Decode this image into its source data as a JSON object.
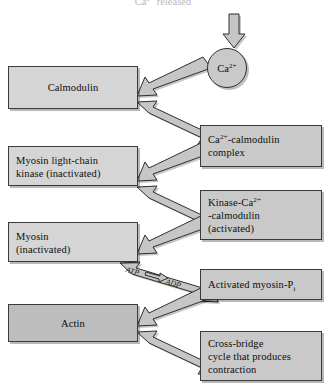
{
  "diagram": {
    "title_cutoff": "Ca2+ released",
    "trigger_arrow": "down-arrow",
    "ion_node": {
      "label": "Ca2+",
      "shape": "circle"
    },
    "left_boxes": [
      {
        "id": "calmodulin",
        "label": "Calmodulin"
      },
      {
        "id": "mlck",
        "lines": [
          "Myosin light-chain",
          "kinase (inactivated)"
        ]
      },
      {
        "id": "myosin",
        "lines": [
          "Myosin",
          "(inactivated)"
        ]
      },
      {
        "id": "actin",
        "label": "Actin"
      }
    ],
    "right_boxes": [
      {
        "id": "ca-calmodulin-complex",
        "lines": [
          "Ca2+-calmodulin",
          "complex"
        ]
      },
      {
        "id": "kinase-ca-calmodulin",
        "lines": [
          "Kinase-Ca2+",
          "-calmodulin",
          "(activated)"
        ]
      },
      {
        "id": "activated-myosin-pi",
        "label": "Activated myosin-Pi"
      },
      {
        "id": "cross-bridge-cycle",
        "lines": [
          "Cross-bridge",
          "cycle that produces",
          "contraction"
        ]
      }
    ],
    "energy_label": {
      "from": "ATP",
      "to": "ADP",
      "arrow": "right-arrow"
    },
    "colors": {
      "box_fill": "#c9c9c9",
      "box_fill_light": "#d5d5d5",
      "box_fill_dark": "#bdbdbd",
      "stroke": "#3a3a3a",
      "arrow_fill": "#c6c6c6",
      "page_background": "#ffffff"
    }
  }
}
